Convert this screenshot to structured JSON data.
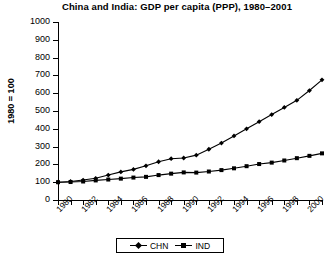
{
  "chart_data": {
    "type": "line",
    "title": "China and India: GDP per capita (PPP), 1980–2001",
    "xlabel": "",
    "ylabel": "1980 = 100",
    "ylim": [
      0,
      1000
    ],
    "yticks": [
      0,
      100,
      200,
      300,
      400,
      500,
      600,
      700,
      800,
      900,
      1000
    ],
    "xlim": [
      1980,
      2001
    ],
    "x": [
      1980,
      1981,
      1982,
      1983,
      1984,
      1985,
      1986,
      1987,
      1988,
      1989,
      1990,
      1991,
      1992,
      1993,
      1994,
      1995,
      1996,
      1997,
      1998,
      1999,
      2000,
      2001
    ],
    "xticks": [
      1980,
      1982,
      1984,
      1986,
      1988,
      1990,
      1992,
      1994,
      1996,
      1998,
      2000
    ],
    "xticklabels": [
      "1980",
      "1982",
      "1984",
      "1986",
      "1988",
      "1990",
      "1992",
      "1994",
      "1996",
      "1998",
      "2000"
    ],
    "grid": false,
    "legend_position": "bottom-center",
    "series": [
      {
        "name": "CHN",
        "marker": "diamond",
        "color": "#000000",
        "values": [
          100,
          104,
          112,
          122,
          140,
          158,
          172,
          192,
          215,
          232,
          236,
          252,
          285,
          320,
          360,
          400,
          440,
          480,
          520,
          560,
          615,
          675
        ]
      },
      {
        "name": "IND",
        "marker": "square",
        "color": "#000000",
        "values": [
          100,
          101,
          104,
          110,
          115,
          120,
          126,
          130,
          140,
          148,
          155,
          154,
          160,
          168,
          178,
          190,
          202,
          210,
          222,
          235,
          248,
          262
        ]
      }
    ]
  },
  "legend": {
    "items": [
      {
        "label": "CHN"
      },
      {
        "label": "IND"
      }
    ]
  }
}
